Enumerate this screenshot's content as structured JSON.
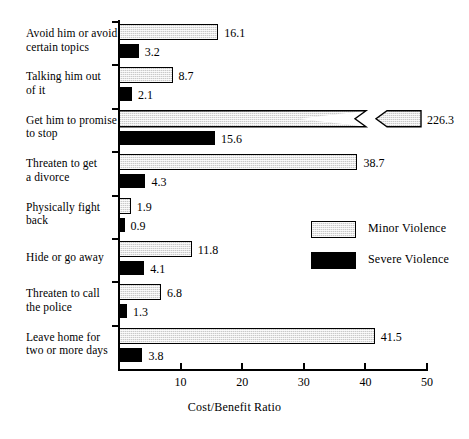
{
  "chart_data": {
    "type": "bar",
    "orientation": "horizontal",
    "title": "",
    "xlabel": "Cost/Benefit Ratio",
    "ylabel": "",
    "xlim": [
      0,
      50
    ],
    "xticks": [
      10,
      20,
      30,
      40,
      50
    ],
    "grid": false,
    "legend_position": "middle-right",
    "axis_break_note": "Minor Violence bar for 'Get him to promise to stop' is broken; true value 226.3 exceeds axis maximum of 50",
    "categories": [
      "Avoid him or avoid certain topics",
      "Talking him out of it",
      "Get him to promise to stop",
      "Threaten to get a divorce",
      "Physically fight back",
      "Hide or go away",
      "Threaten to call the police",
      "Leave home for two or more days"
    ],
    "category_lines": [
      [
        "Avoid him or avoid",
        "certain topics"
      ],
      [
        "Talking him out",
        "of it"
      ],
      [
        "Get him to promise",
        "to stop"
      ],
      [
        "Threaten to get",
        "a divorce"
      ],
      [
        "Physically fight",
        "back"
      ],
      [
        "Hide or go away"
      ],
      [
        "Threaten to call",
        "the police"
      ],
      [
        "Leave home for",
        "two or more days"
      ]
    ],
    "series": [
      {
        "name": "Minor Violence",
        "color": "#c9c9c9",
        "values": [
          16.1,
          8.7,
          226.3,
          38.7,
          1.9,
          11.8,
          6.8,
          41.5
        ],
        "labels": [
          "16.1",
          "8.7",
          "226.3",
          "38.7",
          "1.9",
          "11.8",
          "6.8",
          "41.5"
        ]
      },
      {
        "name": "Severe Violence",
        "color": "#000000",
        "values": [
          3.2,
          2.1,
          15.6,
          4.3,
          0.9,
          4.1,
          1.3,
          3.8
        ],
        "labels": [
          "3.2",
          "2.1",
          "15.6",
          "4.3",
          "0.9",
          "4.1",
          "1.3",
          "3.8"
        ]
      }
    ]
  },
  "legend": {
    "entries": [
      {
        "label": "Minor Violence",
        "swatch": "minor-violence-swatch"
      },
      {
        "label": "Severe Violence",
        "swatch": "severe-violence-swatch"
      }
    ]
  },
  "axis": {
    "x_title": "Cost/Benefit Ratio",
    "tick_labels": [
      "10",
      "20",
      "30",
      "40",
      "50"
    ]
  }
}
